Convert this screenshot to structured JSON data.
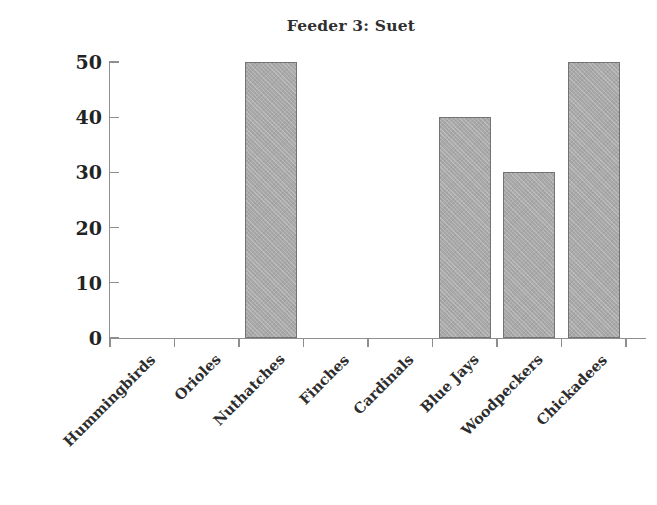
{
  "chart_data": {
    "type": "bar",
    "title": "Feeder 3: Suet",
    "xlabel": "",
    "ylabel": "",
    "categories": [
      "Hummingbirds",
      "Orioles",
      "Nuthatches",
      "Finches",
      "Cardinals",
      "Blue Jays",
      "Woodpeckers",
      "Chickadees"
    ],
    "values": [
      0,
      0,
      50,
      0,
      0,
      40,
      30,
      50
    ],
    "ylim": [
      0,
      50
    ],
    "ytick_labels": [
      "0",
      "10",
      "20",
      "30",
      "40",
      "50"
    ],
    "ytick_values": [
      0,
      10,
      20,
      30,
      40,
      50
    ],
    "grid": false,
    "legend": false,
    "bar_fill_color": "#a9a9a9",
    "bar_border_color": "#737373",
    "axis_color": "#8e8e8e",
    "text_color": "#2d2d2d"
  }
}
